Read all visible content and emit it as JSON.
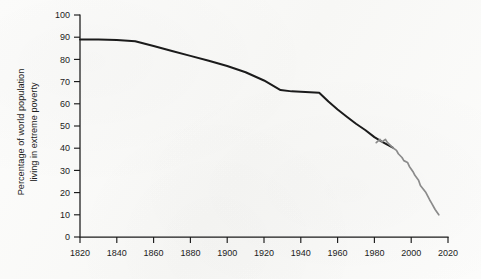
{
  "chart_data": {
    "type": "line",
    "title": "",
    "xlabel": "",
    "ylabel_line1": "Percentage of world population",
    "ylabel_line2": "living in extreme poverty",
    "xlim": [
      1820,
      2020
    ],
    "ylim": [
      0,
      100
    ],
    "grid": false,
    "legend": "none",
    "x_ticks": [
      1820,
      1840,
      1860,
      1880,
      1900,
      1920,
      1940,
      1960,
      1980,
      2000,
      2020
    ],
    "x_tick_labels": [
      "1820",
      "1840",
      "1860",
      "1880",
      "1900",
      "1920",
      "1940",
      "1960",
      "1980",
      "2000",
      "2020"
    ],
    "y_ticks": [
      0,
      10,
      20,
      30,
      40,
      50,
      60,
      70,
      80,
      90,
      100
    ],
    "y_tick_labels": [
      "0",
      "10",
      "20",
      "30",
      "40",
      "50",
      "60",
      "70",
      "80",
      "90",
      "100"
    ],
    "series": [
      {
        "name": "historical-estimate",
        "color": "#1b1b1b",
        "width": 2.0,
        "x": [
          1820,
          1830,
          1840,
          1850,
          1860,
          1870,
          1880,
          1890,
          1900,
          1910,
          1920,
          1929,
          1935,
          1940,
          1945,
          1950,
          1955,
          1960,
          1965,
          1970,
          1975,
          1980,
          1984,
          1987,
          1990
        ],
        "y": [
          89.0,
          89.0,
          88.7,
          88.2,
          86.0,
          83.8,
          81.6,
          79.4,
          77.0,
          74.2,
          70.5,
          66.2,
          65.6,
          65.4,
          65.2,
          65.0,
          61.0,
          57.4,
          54.2,
          51.0,
          48.2,
          45.0,
          43.0,
          41.6,
          40.3
        ]
      },
      {
        "name": "recent-data",
        "color": "#8b8b8b",
        "width": 1.7,
        "x": [
          1981,
          1983,
          1984,
          1986,
          1987,
          1989,
          1990,
          1992,
          1993,
          1995,
          1996,
          1998,
          1999,
          2001,
          2002,
          2004,
          2005,
          2008,
          2010,
          2011,
          2013,
          2015
        ],
        "y": [
          42.5,
          44.0,
          42.8,
          44.0,
          42.6,
          41.0,
          40.2,
          39.0,
          37.5,
          35.8,
          34.4,
          33.6,
          31.8,
          29.4,
          27.8,
          25.6,
          23.2,
          20.0,
          16.8,
          15.4,
          12.4,
          10.0
        ]
      }
    ]
  }
}
